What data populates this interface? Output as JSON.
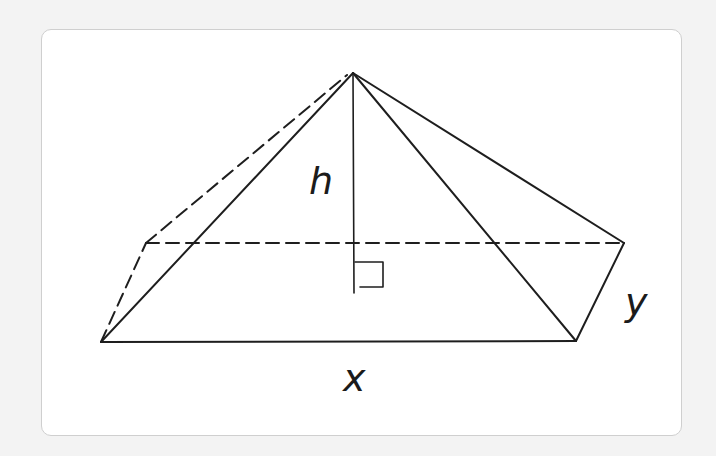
{
  "figure": {
    "type": "rectangular-pyramid",
    "labels": {
      "height": "h",
      "base_length": "x",
      "base_width": "y"
    },
    "right_angle_marker": true,
    "colors": {
      "line": "#1e1e1e",
      "card_background": "#ffffff",
      "page_background": "#f3f3f3",
      "card_border": "#cfcfcf"
    }
  }
}
